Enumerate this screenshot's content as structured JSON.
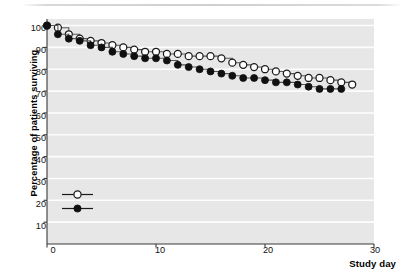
{
  "chart_data": {
    "type": "line",
    "title": "",
    "xlabel": "Study day",
    "ylabel": "Percentage of patients surviving",
    "xlim": [
      0,
      30
    ],
    "ylim": [
      0,
      103
    ],
    "xticks": [
      0,
      10,
      20,
      30
    ],
    "yticks": [
      10,
      20,
      30,
      40,
      50,
      60,
      70,
      80,
      90,
      100
    ],
    "grid": "horizontal",
    "legend_position": "lower-left-inside",
    "plot_background": "#e7e7e7",
    "gridline_color": "#ffffff",
    "series": [
      {
        "name": "Placebo",
        "n": 353,
        "legend_label": "Placebo (n = 353)",
        "marker": "open-circle",
        "marker_fill": "#ffffff",
        "marker_stroke": "#1a1a1a",
        "line_color": "#555555",
        "x": [
          0,
          1,
          2,
          3,
          4,
          5,
          6,
          7,
          8,
          9,
          10,
          11,
          12,
          13,
          14,
          15,
          16,
          17,
          18,
          19,
          20,
          21,
          22,
          23,
          24,
          25,
          26,
          27,
          28
        ],
        "y": [
          100,
          99,
          96,
          94,
          93,
          92,
          91,
          90,
          89,
          88,
          88,
          87,
          87,
          86,
          86,
          86,
          85,
          83,
          82,
          81,
          80,
          79,
          78,
          77,
          76,
          76,
          75,
          74,
          73
        ]
      },
      {
        "name": "Filgrastim",
        "n": 348,
        "legend_label": "Filgrastim (n = 348)",
        "marker": "filled-circle",
        "marker_fill": "#101010",
        "marker_stroke": "#101010",
        "line_color": "#555555",
        "x": [
          0,
          1,
          2,
          3,
          4,
          5,
          6,
          7,
          8,
          9,
          10,
          11,
          12,
          13,
          14,
          15,
          16,
          17,
          18,
          19,
          20,
          21,
          22,
          23,
          24,
          25,
          26,
          27
        ],
        "y": [
          100,
          96,
          94,
          93,
          91,
          90,
          88,
          87,
          86,
          85,
          85,
          84,
          82,
          81,
          80,
          79,
          78,
          77,
          76,
          76,
          75,
          74,
          74,
          73,
          72,
          71,
          71,
          71
        ]
      }
    ]
  },
  "axis": {
    "y_tick_labels": [
      "100",
      "90",
      "80",
      "70",
      "60",
      "50",
      "40",
      "30",
      "20",
      "10"
    ],
    "x_tick_labels": [
      "0",
      "10",
      "20",
      "30"
    ],
    "y_title": "Percentage of patients surviving",
    "x_title": "Study day"
  },
  "legend": {
    "entries": [
      {
        "label_prefix": "Placebo (",
        "italic_n": "n",
        "label_suffix": " = 353)",
        "full": "Placebo (n = 353)"
      },
      {
        "label_prefix": "Filgrastim (",
        "italic_n": "n",
        "label_suffix": " = 348)",
        "full": "Filgrastim (n = 348)"
      }
    ]
  }
}
